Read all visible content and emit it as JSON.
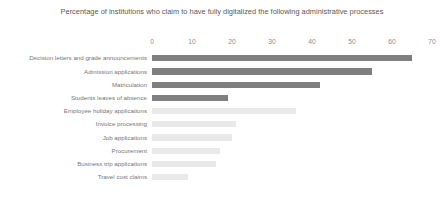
{
  "chart_data": {
    "type": "bar",
    "orientation": "horizontal",
    "title": "Percentage of institutions who claim to have fully digitalized the following administrative processes",
    "title_line1": "Percentage of institutions who claim to have fully digitalized the following administrative",
    "title_line2": "processes",
    "xlabel": "",
    "ylabel": "",
    "xlim": [
      0,
      70
    ],
    "xticks": [
      0,
      10,
      20,
      30,
      40,
      50,
      60,
      70
    ],
    "xtick_labels": [
      "0",
      "10",
      "20",
      "30",
      "40",
      "50",
      "60",
      "70"
    ],
    "grid": false,
    "legend": "none",
    "categories": [
      "Decision letters and grade announcements",
      "Admission applications",
      "Matriculation",
      "Students leaves of absence",
      "Employee holiday applications",
      "Invoice processing",
      "Job applications",
      "Procurement",
      "Business trip applications",
      "Travel cost claims"
    ],
    "values": [
      65,
      55,
      42,
      19,
      36,
      21,
      20,
      17,
      16,
      9
    ],
    "bar_colors": [
      "#7f7f7f",
      "#7f7f7f",
      "#7f7f7f",
      "#7f7f7f",
      "#e9e9e9",
      "#e9e9e9",
      "#e9e9e9",
      "#e9e9e9",
      "#e9e9e9",
      "#e9e9e9"
    ],
    "colors": {
      "dark_bar": "#7f7f7f",
      "light_bar": "#e9e9e9",
      "title_text": "#595959",
      "tick_text": "#8c8c8c",
      "label_text": "#767676",
      "background": "#ffffff"
    }
  }
}
